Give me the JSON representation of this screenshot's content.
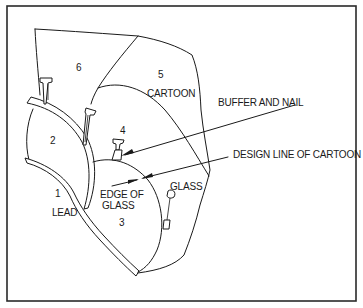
{
  "diagram": {
    "colors": {
      "line": "#1a1a1a",
      "background": "#ffffff",
      "frame": "#2a2a2a"
    },
    "piece_numbers": [
      "1",
      "2",
      "3",
      "4",
      "5",
      "6"
    ],
    "labels": {
      "cartoon": "CARTOON",
      "lead": "LEAD",
      "edge_of_glass_line1": "EDGE OF",
      "edge_of_glass_line2": "GLASS",
      "glass": "GLASS"
    },
    "callouts": {
      "buffer_and_nail": "BUFFER AND NAIL",
      "design_line": "DESIGN LINE OF CARTOON"
    },
    "icons": [
      "nail-icon",
      "arrow-icon"
    ]
  }
}
